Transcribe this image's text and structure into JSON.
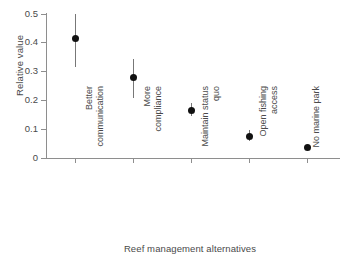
{
  "figure": {
    "title_remnant": "",
    "background_color": "#ffffff",
    "axis_color": "#8e8e8e",
    "marker_color": "#111111",
    "errorbar_color": "#777777",
    "text_color": "#4a4a4a"
  },
  "axes": {
    "ylabel": "Relative value",
    "xlabel": "Reef management alternatives",
    "ytick_labels": [
      "0.5",
      "0.4",
      "0.3",
      "0.2",
      "0.1",
      "0"
    ],
    "ytick_values": [
      0.5,
      0.4,
      0.3,
      0.2,
      0.1,
      0
    ]
  },
  "chart_data": {
    "type": "scatter",
    "title": "",
    "xlabel": "Reef management alternatives",
    "ylabel": "Relative value",
    "ylim": [
      0,
      0.5
    ],
    "grid": false,
    "legend": null,
    "error_bars": "vertical",
    "categories": [
      "Better communication",
      "More compliance",
      "Maintain status quo",
      "Open fishing access",
      "No marine park"
    ],
    "category_lines": [
      [
        "Better",
        "communication"
      ],
      [
        "More",
        "compliance"
      ],
      [
        "Maintain status",
        "quo"
      ],
      [
        "Open fishing",
        "access"
      ],
      [
        "No marine park",
        ""
      ]
    ],
    "values": [
      0.412,
      0.277,
      0.164,
      0.074,
      0.037
    ],
    "error_low": [
      0.315,
      0.208,
      0.145,
      0.058,
      0.037
    ],
    "error_high": [
      0.5,
      0.343,
      0.19,
      0.098,
      0.037
    ],
    "points": [
      {
        "category": "Better communication",
        "value": 0.412,
        "low": 0.315,
        "high": 0.5
      },
      {
        "category": "More compliance",
        "value": 0.277,
        "low": 0.208,
        "high": 0.343
      },
      {
        "category": "Maintain status quo",
        "value": 0.164,
        "low": 0.145,
        "high": 0.19
      },
      {
        "category": "Open fishing access",
        "value": 0.074,
        "low": 0.058,
        "high": 0.098
      },
      {
        "category": "No marine park",
        "value": 0.037,
        "low": 0.037,
        "high": 0.037
      }
    ]
  }
}
